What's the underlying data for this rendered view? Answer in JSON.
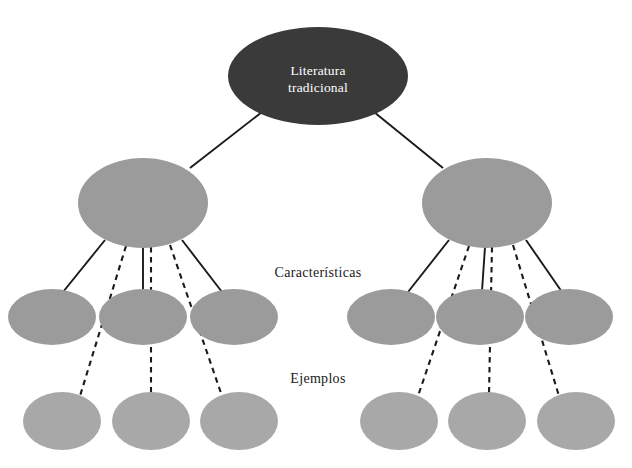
{
  "diagram": {
    "background_color": "#ffffff",
    "root": {
      "label_line1": "Literatura",
      "label_line2": "tradicional",
      "fill": "#3a3a3a",
      "text_color": "#ffffff",
      "cx": 318,
      "cy": 76,
      "rx": 90,
      "ry": 49
    },
    "row_labels": {
      "characteristics": "Características",
      "examples": "Ejemplos"
    },
    "branch_fill": "#9b9b9b",
    "leaf_fill": "#a8a8a8",
    "edge_color": "#1a1a1a",
    "branches": [
      {
        "name": "left-branch",
        "node": {
          "cx": 143,
          "cy": 203,
          "rx": 65,
          "ry": 45
        },
        "characteristics": [
          {
            "cx": 52,
            "cy": 317,
            "rx": 44,
            "ry": 28
          },
          {
            "cx": 143,
            "cy": 317,
            "rx": 44,
            "ry": 28
          },
          {
            "cx": 234,
            "cy": 317,
            "rx": 44,
            "ry": 28
          }
        ],
        "examples": [
          {
            "cx": 62,
            "cy": 421,
            "rx": 39,
            "ry": 29
          },
          {
            "cx": 151,
            "cy": 421,
            "rx": 39,
            "ry": 29
          },
          {
            "cx": 239,
            "cy": 421,
            "rx": 39,
            "ry": 29
          }
        ]
      },
      {
        "name": "right-branch",
        "node": {
          "cx": 487,
          "cy": 203,
          "rx": 65,
          "ry": 45
        },
        "characteristics": [
          {
            "cx": 391,
            "cy": 317,
            "rx": 44,
            "ry": 28
          },
          {
            "cx": 480,
            "cy": 317,
            "rx": 44,
            "ry": 28
          },
          {
            "cx": 569,
            "cy": 317,
            "rx": 44,
            "ry": 28
          }
        ],
        "examples": [
          {
            "cx": 399,
            "cy": 421,
            "rx": 39,
            "ry": 29
          },
          {
            "cx": 487,
            "cy": 421,
            "rx": 39,
            "ry": 29
          },
          {
            "cx": 576,
            "cy": 421,
            "rx": 39,
            "ry": 29
          }
        ]
      }
    ],
    "edges": {
      "root_to_branch": [
        {
          "name": "root-to-left-branch",
          "x1": 262,
          "y1": 112,
          "x2": 190,
          "y2": 168
        },
        {
          "name": "root-to-right-branch",
          "x1": 374,
          "y1": 112,
          "x2": 443,
          "y2": 168
        }
      ],
      "solid_characteristics": [
        {
          "name": "left-branch-to-characteristic-1",
          "x1": 105,
          "y1": 240,
          "x2": 63,
          "y2": 292
        },
        {
          "name": "left-branch-to-characteristic-2",
          "x1": 143,
          "y1": 247,
          "x2": 143,
          "y2": 291
        },
        {
          "name": "left-branch-to-characteristic-3",
          "x1": 182,
          "y1": 240,
          "x2": 222,
          "y2": 292
        },
        {
          "name": "right-branch-to-characteristic-1",
          "x1": 449,
          "y1": 240,
          "x2": 408,
          "y2": 292
        },
        {
          "name": "right-branch-to-characteristic-2",
          "x1": 485,
          "y1": 247,
          "x2": 482,
          "y2": 291
        },
        {
          "name": "right-branch-to-characteristic-3",
          "x1": 526,
          "y1": 240,
          "x2": 562,
          "y2": 292
        }
      ],
      "dashed_examples": [
        {
          "name": "left-branch-to-example-1",
          "x1": 126,
          "y1": 246,
          "x2": 80,
          "y2": 396
        },
        {
          "name": "left-branch-to-example-2",
          "x1": 151,
          "y1": 247,
          "x2": 151,
          "y2": 394
        },
        {
          "name": "left-branch-to-example-3",
          "x1": 170,
          "y1": 245,
          "x2": 222,
          "y2": 396
        },
        {
          "name": "right-branch-to-example-1",
          "x1": 469,
          "y1": 246,
          "x2": 418,
          "y2": 396
        },
        {
          "name": "right-branch-to-example-2",
          "x1": 492,
          "y1": 247,
          "x2": 489,
          "y2": 394
        },
        {
          "name": "right-branch-to-example-3",
          "x1": 513,
          "y1": 245,
          "x2": 559,
          "y2": 396
        }
      ]
    },
    "row_label_positions": {
      "characteristics": {
        "x": 318,
        "y": 277
      },
      "examples": {
        "x": 318,
        "y": 383
      }
    }
  }
}
